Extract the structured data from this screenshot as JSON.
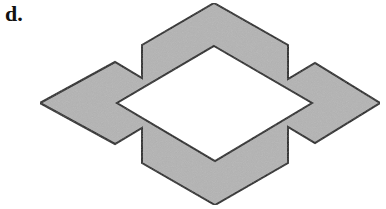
{
  "figure": {
    "label": "d.",
    "fill_color": "#b4b4b4",
    "stroke_color": "#1a1a1a",
    "background": "#ffffff",
    "shape": {
      "description": "Gray diamond-shaped frame with a white diamond hole, notched arms on left and right",
      "outer_points": "214,3 288,45 288,79 315,63 380,103 315,143 288,127 288,163 215,205 142,163 142,128 115,144 40,103 115,62 142,78 142,45",
      "inner_points": "214,46 312,103 215,161 117,103"
    }
  }
}
